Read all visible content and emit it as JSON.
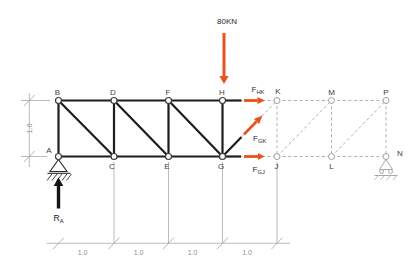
{
  "diagram": {
    "canvas": {
      "width": 415,
      "height": 274,
      "background": "#ffffff"
    },
    "colors": {
      "member": "#1d1d1b",
      "ghost": "#b2b2b2",
      "dimension": "#a9a9a9",
      "force": "#e8521d",
      "reaction": "#141414",
      "node_fill": "#ffffff",
      "node_stroke": "#3c3c3b",
      "ghost_node_stroke": "#a0a0a0",
      "support": "#2a2a2a",
      "roller": "#a8a8a8"
    },
    "nodes": [
      {
        "id": "A",
        "x": 58.5,
        "y": 156.5,
        "lx": 49,
        "ly": 153,
        "ghost": false
      },
      {
        "id": "B",
        "x": 58.5,
        "y": 100.5,
        "lx": 57.5,
        "ly": 95,
        "ghost": false
      },
      {
        "id": "C",
        "x": 114,
        "y": 156.5,
        "lx": 112,
        "ly": 169,
        "ghost": false
      },
      {
        "id": "D",
        "x": 114,
        "y": 100.5,
        "lx": 113,
        "ly": 95,
        "ghost": false
      },
      {
        "id": "E",
        "x": 168.5,
        "y": 156.5,
        "lx": 167,
        "ly": 169,
        "ghost": false
      },
      {
        "id": "F",
        "x": 168.5,
        "y": 100.5,
        "lx": 168,
        "ly": 95,
        "ghost": false
      },
      {
        "id": "G",
        "x": 222.5,
        "y": 156.5,
        "lx": 221,
        "ly": 169,
        "ghost": false
      },
      {
        "id": "H",
        "x": 222.5,
        "y": 100.5,
        "lx": 222,
        "ly": 95,
        "ghost": false
      },
      {
        "id": "J",
        "x": 277,
        "y": 156.5,
        "lx": 276.5,
        "ly": 169,
        "ghost": true
      },
      {
        "id": "K",
        "x": 277,
        "y": 100.5,
        "lx": 278,
        "ly": 94,
        "ghost": true
      },
      {
        "id": "L",
        "x": 331.5,
        "y": 156.5,
        "lx": 331.5,
        "ly": 169,
        "ghost": true
      },
      {
        "id": "M",
        "x": 331.5,
        "y": 100.5,
        "lx": 331.5,
        "ly": 95,
        "ghost": true
      },
      {
        "id": "N",
        "x": 386,
        "y": 156.5,
        "lx": 400,
        "ly": 156,
        "ghost": true
      },
      {
        "id": "P",
        "x": 386,
        "y": 100.5,
        "lx": 386,
        "ly": 95,
        "ghost": true
      }
    ],
    "members": [
      [
        "B",
        "D"
      ],
      [
        "D",
        "F"
      ],
      [
        "F",
        "H"
      ],
      [
        "A",
        "C"
      ],
      [
        "C",
        "E"
      ],
      [
        "E",
        "G"
      ],
      [
        "A",
        "B"
      ],
      [
        "C",
        "D"
      ],
      [
        "E",
        "F"
      ],
      [
        "G",
        "H"
      ],
      [
        "B",
        "C"
      ],
      [
        "D",
        "E"
      ],
      [
        "F",
        "G"
      ]
    ],
    "ghost_members": [
      [
        "H",
        "K"
      ],
      [
        "G",
        "K"
      ],
      [
        "G",
        "J"
      ],
      [
        "K",
        "M"
      ],
      [
        "M",
        "P"
      ],
      [
        "J",
        "L"
      ],
      [
        "L",
        "N"
      ],
      [
        "K",
        "J"
      ],
      [
        "M",
        "L"
      ],
      [
        "P",
        "N"
      ],
      [
        "J",
        "M"
      ],
      [
        "L",
        "P"
      ]
    ],
    "cut_stubs": [
      {
        "x1": 222.5,
        "y1": 100.5,
        "x2": 241.5,
        "y2": 100.5
      },
      {
        "x1": 222.5,
        "y1": 156.5,
        "x2": 241.5,
        "y2": 137
      },
      {
        "x1": 222.5,
        "y1": 156.5,
        "x2": 241,
        "y2": 156.5
      }
    ],
    "load": {
      "label": "80KN",
      "x": 224,
      "y1": 33,
      "y2": 76,
      "tip": 84,
      "shaft_w": 3,
      "head_hw": 4.6,
      "label_x": 227,
      "label_y": 24
    },
    "forces": [
      {
        "name": "F",
        "sub": "HK",
        "x1": 244,
        "y1": 100.5,
        "x2": 257.5,
        "y2": 100.5,
        "tx": 265,
        "ty": 100.5,
        "label_x": 251.5,
        "label_y": 91.5
      },
      {
        "name": "F",
        "sub": "GK",
        "x1": 244,
        "y1": 134.4,
        "x2": 256.5,
        "y2": 121.5,
        "tx": 262.5,
        "ty": 115.4,
        "label_x": 253,
        "label_y": 140.5
      },
      {
        "name": "F",
        "sub": "GJ",
        "x1": 244,
        "y1": 156.5,
        "x2": 258,
        "y2": 156.5,
        "tx": 264.5,
        "ty": 156.5,
        "label_x": 252.5,
        "label_y": 171.5
      }
    ],
    "reaction": {
      "name": "R",
      "sub": "A",
      "x": 58.5,
      "y1": 208.5,
      "y2": 186,
      "tip": 177.5,
      "shaft_w": 3.4,
      "head_hw": 4.8,
      "label_x": 53.5,
      "label_y": 221
    },
    "supports": {
      "pin": {
        "triangle": "58.5,159.5 50,171.5 67,171.5",
        "ground": {
          "x1": 47.5,
          "y1": 173.3,
          "x2": 70.5,
          "y2": 173.3
        },
        "hatches": [
          [
            52,
            174,
            47,
            180.5
          ],
          [
            57,
            174,
            52,
            180.5
          ],
          [
            62,
            174,
            57,
            180.5
          ],
          [
            67,
            174,
            62,
            180.5
          ],
          [
            71.5,
            174,
            66.5,
            180.5
          ]
        ]
      },
      "roller": {
        "triangle": "386,159.5 379.5,169.5 392.5,169.5",
        "circles": [
          [
            381.5,
            171.5
          ],
          [
            390.5,
            171.5
          ]
        ],
        "circle_r": 2,
        "ground": {
          "x1": 374.5,
          "y1": 175.5,
          "x2": 397.5,
          "y2": 175.5
        },
        "hatches": [
          [
            378,
            176,
            374.5,
            180
          ],
          [
            384,
            176,
            380.5,
            180
          ],
          [
            390,
            176,
            386.5,
            180
          ],
          [
            396.5,
            176,
            393,
            180
          ]
        ]
      }
    },
    "dimensions": {
      "bottom": {
        "line": {
          "x1": 46.5,
          "y1": 243.3,
          "x2": 290,
          "y2": 243.3
        },
        "ticks": [
          58.5,
          114,
          168.5,
          222.5,
          277
        ],
        "labels": [
          {
            "text": "1.0",
            "x": 82.5,
            "y": 255
          },
          {
            "text": "1.0",
            "x": 138.5,
            "y": 255
          },
          {
            "text": "1.0",
            "x": 192.5,
            "y": 255
          },
          {
            "text": "1.0",
            "x": 247,
            "y": 255
          }
        ],
        "extensions": [
          [
            114,
            162,
            114,
            243
          ],
          [
            168.5,
            162,
            168.5,
            243
          ],
          [
            222.5,
            162,
            222.5,
            243
          ],
          [
            277,
            162,
            277,
            243
          ]
        ]
      },
      "left": {
        "line": {
          "x1": 29.3,
          "y1": 93,
          "x2": 29.3,
          "y2": 167
        },
        "ticks": [
          100.5,
          156.5
        ],
        "label": {
          "text": "1.0",
          "x": 32.3,
          "y": 128.3
        },
        "extensions": [
          [
            21,
            100.5,
            50,
            100.5
          ],
          [
            21,
            156.5,
            47,
            156.5
          ]
        ]
      }
    }
  }
}
